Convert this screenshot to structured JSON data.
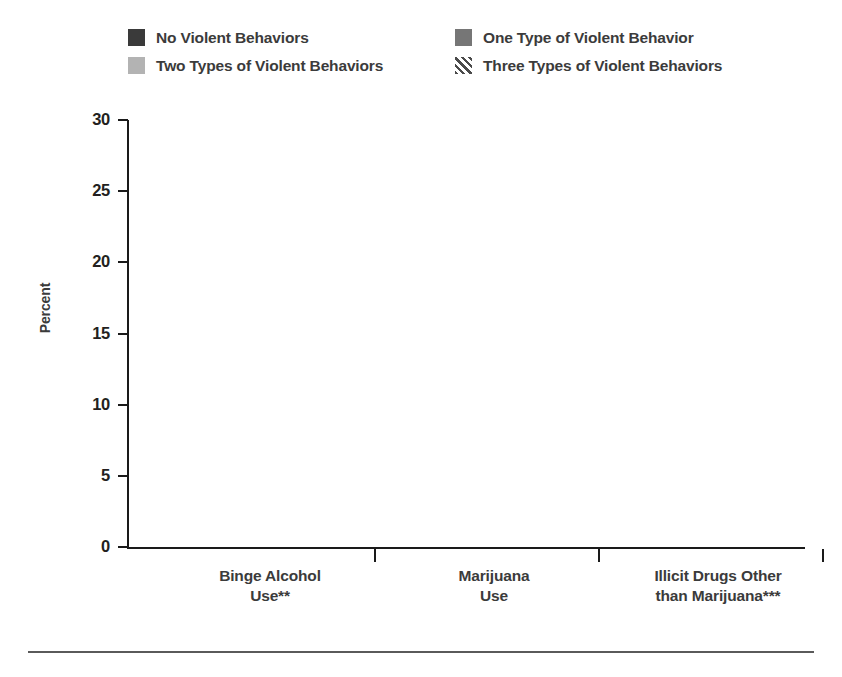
{
  "chart_data": {
    "type": "bar",
    "title": "",
    "xlabel": "",
    "ylabel": "Percent",
    "ylim": [
      0,
      30
    ],
    "ytick_values": [
      0,
      5,
      10,
      15,
      20,
      25,
      30
    ],
    "ytick_labels": [
      "0",
      "5",
      "10",
      "15",
      "20",
      "25",
      "30"
    ],
    "grid": false,
    "legend_position": "top",
    "categories": [
      "Binge Alcohol Use**",
      "Marijuana Use",
      "Illicit Drugs Other than Marijuana***"
    ],
    "category_lines": [
      [
        "Binge Alcohol",
        "Use**"
      ],
      [
        "Marijuana",
        "Use"
      ],
      [
        "Illicit Drugs Other",
        "than Marijuana***"
      ]
    ],
    "series": [
      {
        "name": "No Violent Behaviors",
        "fill": "solid-dark",
        "color": "#3a3a3a",
        "values": [
          6.9,
          4.1,
          3.2
        ],
        "labels": [
          "6.9",
          "4.1",
          "3.2"
        ]
      },
      {
        "name": "One Type of Violent Behavior",
        "fill": "solid-medium",
        "color": "#767676",
        "values": [
          12.6,
          8.9,
          6.7
        ],
        "labels": [
          "12.6",
          "8.9",
          "6.7"
        ]
      },
      {
        "name": "Two Types of Violent Behaviors",
        "fill": "solid-light",
        "color": "#b3b3b3",
        "values": [
          17.3,
          14.0,
          12.0
        ],
        "labels": [
          "17.3",
          "14.0",
          "12.0"
        ]
      },
      {
        "name": "Three Types of Violent Behaviors",
        "fill": "diagonal-hatch",
        "color": "#4a4a4a",
        "values": [
          27.2,
          22.4,
          19.9
        ],
        "labels": [
          "27.2",
          "22.4",
          "19.9"
        ]
      }
    ]
  },
  "legend": {
    "items": [
      {
        "label": "No Violent Behaviors",
        "swatch": "solid-dark"
      },
      {
        "label": "One Type of Violent Behavior",
        "swatch": "solid-medium"
      },
      {
        "label": "Two Types of Violent Behaviors",
        "swatch": "solid-light"
      },
      {
        "label": "Three Types of Violent Behaviors",
        "swatch": "diagonal-hatch"
      }
    ]
  },
  "axis": {
    "y_title": "Percent"
  }
}
